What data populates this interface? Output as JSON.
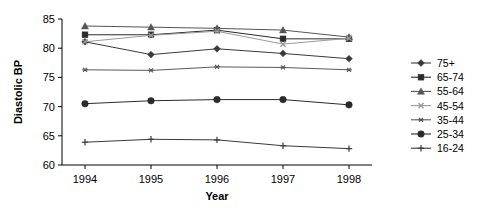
{
  "chart_data": {
    "type": "line",
    "title": "",
    "xlabel": "Year",
    "ylabel": "Diastolic BP",
    "categories": [
      "1994",
      "1995",
      "1996",
      "1997",
      "1998"
    ],
    "x": [
      1994,
      1995,
      1996,
      1997,
      1998
    ],
    "ylim": [
      60,
      85
    ],
    "yticks": [
      60,
      65,
      70,
      75,
      80,
      85
    ],
    "grid": false,
    "legend_position": "right",
    "series": [
      {
        "name": "75+",
        "marker": "diamond",
        "color": "#3a3a3a",
        "values": [
          81.1,
          78.9,
          79.9,
          79.1,
          78.2
        ]
      },
      {
        "name": "65-74",
        "marker": "square",
        "color": "#2b2b2b",
        "values": [
          82.3,
          82.3,
          83.1,
          81.6,
          81.6
        ]
      },
      {
        "name": "55-64",
        "marker": "triangle",
        "color": "#555555",
        "values": [
          83.8,
          83.6,
          83.4,
          83.1,
          81.9
        ]
      },
      {
        "name": "45-54",
        "marker": "x",
        "color": "#9a9a9a",
        "values": [
          81.1,
          82.2,
          82.9,
          80.7,
          81.7
        ]
      },
      {
        "name": "35-44",
        "marker": "asterisk",
        "color": "#5a5a5a",
        "values": [
          76.3,
          76.2,
          76.8,
          76.7,
          76.3
        ]
      },
      {
        "name": "25-34",
        "marker": "circle",
        "color": "#2b2b2b",
        "values": [
          70.5,
          71.0,
          71.2,
          71.2,
          70.3
        ]
      },
      {
        "name": "16-24",
        "marker": "plus",
        "color": "#3a3a3a",
        "values": [
          63.9,
          64.4,
          64.3,
          63.3,
          62.8
        ]
      }
    ]
  },
  "legend": {
    "items": [
      {
        "label": "75+"
      },
      {
        "label": "65-74"
      },
      {
        "label": "55-64"
      },
      {
        "label": "45-54"
      },
      {
        "label": "35-44"
      },
      {
        "label": "25-34"
      },
      {
        "label": "16-24"
      }
    ]
  }
}
